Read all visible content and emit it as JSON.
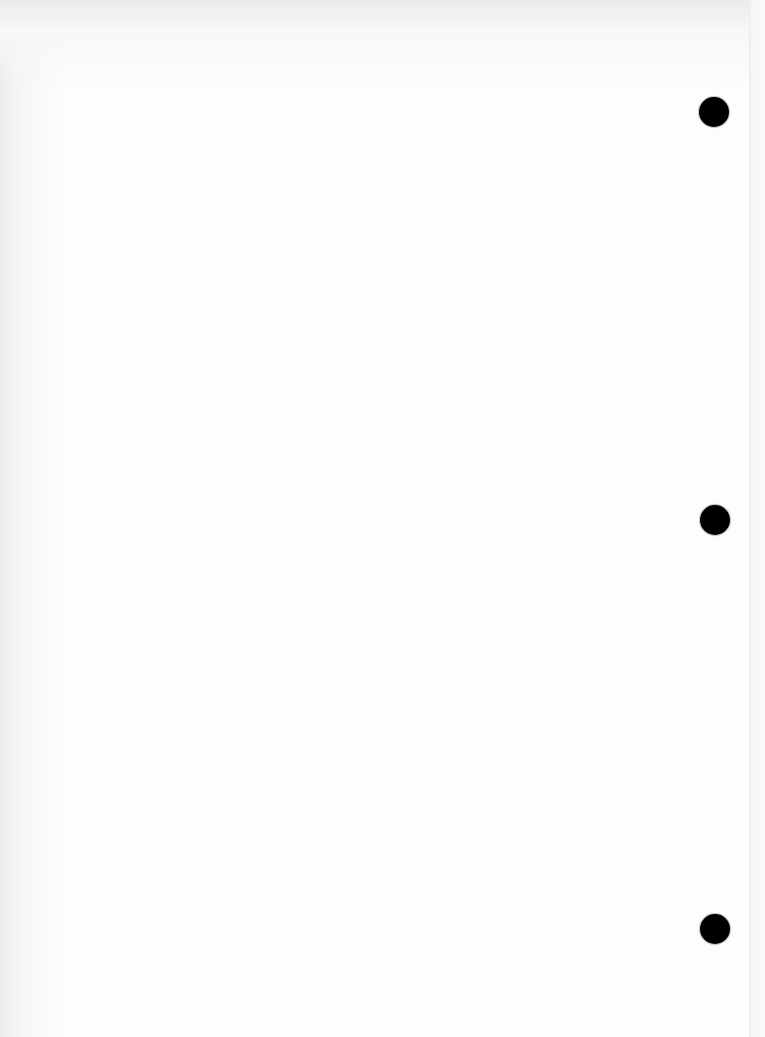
{
  "document": {
    "type": "scanned-blank-page",
    "text": "",
    "punch_holes": [
      {
        "name": "top",
        "cx": 714,
        "cy": 112,
        "diameter": 30
      },
      {
        "name": "middle",
        "cx": 715,
        "cy": 520,
        "diameter": 30
      },
      {
        "name": "bottom",
        "cx": 715,
        "cy": 929,
        "diameter": 30
      }
    ],
    "colors": {
      "paper": "#fdfdfd",
      "edge_shadow": "#ececec",
      "hole": "#000000"
    }
  }
}
